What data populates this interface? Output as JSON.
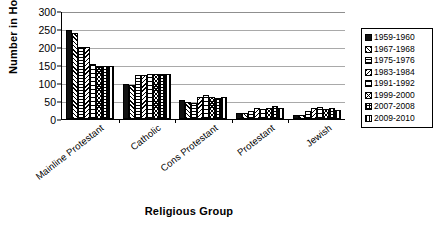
{
  "chart_data": {
    "type": "bar",
    "title": "",
    "xlabel": "Religious Group",
    "ylabel": "Number in House",
    "ylim": [
      0,
      300
    ],
    "yticks": [
      0,
      50,
      100,
      150,
      200,
      250,
      300
    ],
    "grid": true,
    "legend_position": "right",
    "categories": [
      "Mainline Protestant",
      "Catholic",
      "Cons Protestant",
      "Protestant",
      "Jewish"
    ],
    "series": [
      {
        "name": "1959-1960",
        "pattern": "solid-black",
        "values": [
          248,
          97,
          52,
          18,
          10
        ]
      },
      {
        "name": "1967-1968",
        "pattern": "diagonal-up",
        "values": [
          240,
          95,
          48,
          17,
          12
        ]
      },
      {
        "name": "1975-1976",
        "pattern": "horizontal",
        "values": [
          200,
          122,
          44,
          22,
          22
        ]
      },
      {
        "name": "1983-1984",
        "pattern": "diagonal-down",
        "values": [
          200,
          122,
          62,
          30,
          30
        ]
      },
      {
        "name": "1991-1992",
        "pattern": "horizontal-wide",
        "values": [
          152,
          124,
          68,
          28,
          33
        ]
      },
      {
        "name": "1999-2000",
        "pattern": "cross-diagonal",
        "values": [
          148,
          125,
          60,
          30,
          27
        ]
      },
      {
        "name": "2007-2008",
        "pattern": "grid",
        "values": [
          147,
          125,
          58,
          35,
          30
        ]
      },
      {
        "name": "2009-2010",
        "pattern": "vertical",
        "values": [
          146,
          125,
          60,
          30,
          25
        ]
      }
    ]
  },
  "legend": {
    "items": [
      {
        "label": "1959-1960"
      },
      {
        "label": "1967-1968"
      },
      {
        "label": "1975-1976"
      },
      {
        "label": "1983-1984"
      },
      {
        "label": "1991-1992"
      },
      {
        "label": "1999-2000"
      },
      {
        "label": "2007-2008"
      },
      {
        "label": "2009-2010"
      }
    ]
  },
  "axes": {
    "y_title": "Number in House",
    "x_title": "Religious Group"
  }
}
